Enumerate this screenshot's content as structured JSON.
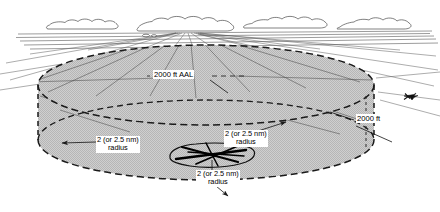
{
  "diagram": {
    "labels": {
      "aal": "2000 ft AAL",
      "altitude": "2000 ft",
      "radius_line1": "2 (or 2.5 nm)",
      "radius_line2": "radius"
    },
    "annotations": [
      {
        "name": "ceiling-label",
        "text": "2000 ft AAL",
        "x": 153,
        "y": 70
      },
      {
        "name": "radius-label-left",
        "text": "2 (or 2.5 nm) radius",
        "x": 96,
        "y": 136
      },
      {
        "name": "radius-label-right",
        "text": "2 (or 2.5 nm) radius",
        "x": 224,
        "y": 130
      },
      {
        "name": "radius-label-bottom",
        "text": "2 (or 2.5 nm) radius",
        "x": 196,
        "y": 170
      },
      {
        "name": "height-label-right",
        "text": "2000 ft",
        "x": 356,
        "y": 114
      }
    ],
    "elements": {
      "clouds": 4,
      "aircraft": 1,
      "cylinder": "shaded gray cylinder with dashed top and bottom ellipses",
      "airfield": "irregular outline with crossing runways"
    },
    "colors": {
      "ink": "#1a1a1a",
      "shade": "#c8c8c8",
      "paper": "#ffffff"
    }
  }
}
